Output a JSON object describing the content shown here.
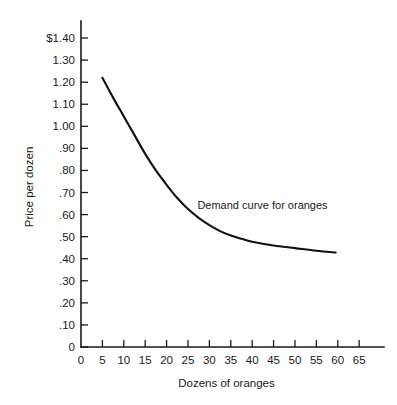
{
  "chart_data": {
    "type": "line",
    "title": "",
    "xlabel": "Dozens of oranges",
    "ylabel": "Price per dozen",
    "xlim": [
      0,
      68
    ],
    "ylim": [
      0,
      1.45
    ],
    "grid": false,
    "legend": "none",
    "annotations": [
      {
        "text": "Demand curve for oranges",
        "x": 30,
        "y": 0.6
      }
    ],
    "xticks": [
      0,
      5,
      10,
      15,
      20,
      25,
      30,
      35,
      40,
      45,
      50,
      55,
      60,
      65
    ],
    "xtick_labels": [
      "0",
      "5",
      "10",
      "15",
      "20",
      "25",
      "30",
      "35",
      "40",
      "45",
      "50",
      "55",
      "60",
      "65"
    ],
    "yticks": [
      0,
      0.1,
      0.2,
      0.3,
      0.4,
      0.5,
      0.6,
      0.7,
      0.8,
      0.9,
      1.0,
      1.1,
      1.2,
      1.3,
      1.4
    ],
    "ytick_labels": [
      "0",
      ".10",
      ".20",
      ".30",
      ".40",
      ".50",
      ".60",
      ".70",
      ".80",
      ".90",
      "1.00",
      "1.10",
      "1.20",
      "1.30",
      "$1.40"
    ],
    "series": [
      {
        "name": "Demand curve for oranges",
        "color": "#111111",
        "x": [
          5,
          7.5,
          10,
          12.5,
          15,
          17.5,
          20,
          22.5,
          25,
          27.5,
          30,
          32.5,
          35,
          37.5,
          40,
          45,
          50,
          55,
          59.5
        ],
        "y": [
          1.22,
          1.13,
          1.045,
          0.96,
          0.875,
          0.8,
          0.735,
          0.675,
          0.625,
          0.585,
          0.552,
          0.525,
          0.505,
          0.49,
          0.477,
          0.46,
          0.448,
          0.436,
          0.428
        ]
      }
    ]
  },
  "figure": {
    "background_color": "#ffffff",
    "axis_color": "#1a1a1a"
  }
}
